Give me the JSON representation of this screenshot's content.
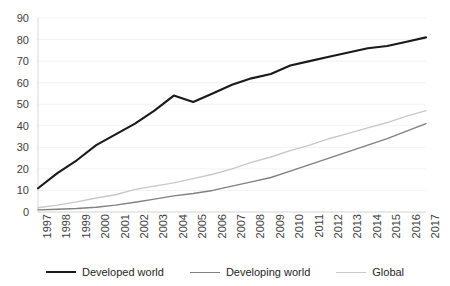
{
  "chart_data": {
    "type": "line",
    "title": "",
    "subtitle": "",
    "xlabel": "",
    "ylabel": "",
    "x": [
      1997,
      1998,
      1999,
      2000,
      2001,
      2002,
      2003,
      2004,
      2005,
      2006,
      2007,
      2008,
      2009,
      2010,
      2011,
      2012,
      2013,
      2014,
      2015,
      2016,
      2017
    ],
    "categories": [
      "1997",
      "1998",
      "1999",
      "2000",
      "2001",
      "2002",
      "2003",
      "2004",
      "2005",
      "2006",
      "2007",
      "2008",
      "2009",
      "2010",
      "2011",
      "2012",
      "2013",
      "2014",
      "2015",
      "2016",
      "2017"
    ],
    "series": [
      {
        "name": "Developed world",
        "color": "#1a1a1a",
        "width": 2.1,
        "values": [
          11,
          18,
          24,
          31,
          36,
          41,
          47,
          54,
          51,
          55,
          59,
          62,
          64,
          68,
          70,
          72,
          74,
          76,
          77,
          79,
          81
        ]
      },
      {
        "name": "Developing world",
        "color": "#808080",
        "width": 1.4,
        "values": [
          1,
          1.3,
          1.6,
          2.2,
          3.2,
          4.5,
          6,
          7.5,
          8.6,
          10,
          12,
          14,
          16,
          19,
          22,
          25,
          28,
          31,
          34,
          37.5,
          41
        ]
      },
      {
        "name": "Global",
        "color": "#c8c8c8",
        "width": 1.4,
        "values": [
          2,
          3.2,
          4.7,
          6.5,
          8,
          10.5,
          12,
          13.5,
          15.5,
          17.5,
          20,
          23,
          25.5,
          28.5,
          31,
          34,
          36.5,
          39,
          41.5,
          44.5,
          47
        ]
      }
    ],
    "ylim": [
      0,
      90
    ],
    "xlim": [
      1997,
      2017
    ],
    "y_ticks": [
      0,
      10,
      20,
      30,
      40,
      50,
      60,
      70,
      80,
      90
    ],
    "y_tick_labels": [
      "0",
      "10",
      "20",
      "30",
      "40",
      "50",
      "60",
      "70",
      "80",
      "90"
    ],
    "grid": true,
    "grid_color": "#f2f2f2",
    "axis_color": "#d9d9d9",
    "legend_position": "bottom"
  },
  "legend": {
    "items": [
      {
        "label": "Developed world",
        "color": "#1a1a1a",
        "width": "2.2px"
      },
      {
        "label": "Developing world",
        "color": "#808080",
        "width": "1.5px"
      },
      {
        "label": "Global",
        "color": "#c8c8c8",
        "width": "1.5px"
      }
    ]
  }
}
